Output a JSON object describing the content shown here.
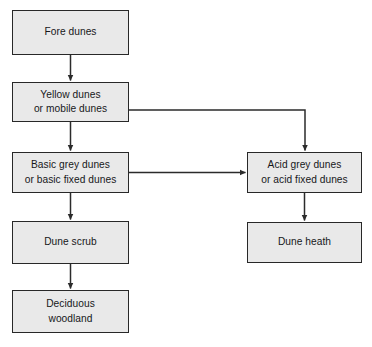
{
  "diagram": {
    "type": "flowchart",
    "orientation": "top-to-bottom",
    "background_color": "#ffffff",
    "node_fill_color": "#e9e9e9",
    "node_border_color": "#282828",
    "connector_color": "#2b2b2b",
    "text_color": "#17181a",
    "nodes": [
      {
        "id": "fore-dunes",
        "label": "Fore dunes",
        "column": "left",
        "order": 1
      },
      {
        "id": "yellow-dunes",
        "label": "Yellow dunes\nor mobile dunes",
        "column": "left",
        "order": 2
      },
      {
        "id": "basic-grey",
        "label": "Basic grey dunes\nor basic fixed dunes",
        "column": "left",
        "order": 3
      },
      {
        "id": "dune-scrub",
        "label": "Dune scrub",
        "column": "left",
        "order": 4
      },
      {
        "id": "deciduous",
        "label": "Deciduous\nwoodland",
        "column": "left",
        "order": 5
      },
      {
        "id": "acid-grey",
        "label": "Acid grey dunes\nor acid fixed dunes",
        "column": "right",
        "order": 1
      },
      {
        "id": "dune-heath",
        "label": "Dune heath",
        "column": "right",
        "order": 2
      }
    ],
    "edges": [
      {
        "id": "e1",
        "from": "fore-dunes",
        "to": "yellow-dunes",
        "style": "straight-down"
      },
      {
        "id": "e2",
        "from": "yellow-dunes",
        "to": "basic-grey",
        "style": "straight-down"
      },
      {
        "id": "e3",
        "from": "yellow-dunes",
        "to": "acid-grey",
        "style": "elbow-right-down"
      },
      {
        "id": "e4",
        "from": "basic-grey",
        "to": "acid-grey",
        "style": "straight-right"
      },
      {
        "id": "e5",
        "from": "basic-grey",
        "to": "dune-scrub",
        "style": "straight-down"
      },
      {
        "id": "e6",
        "from": "dune-scrub",
        "to": "deciduous",
        "style": "straight-down"
      },
      {
        "id": "e7",
        "from": "acid-grey",
        "to": "dune-heath",
        "style": "straight-down"
      }
    ]
  }
}
